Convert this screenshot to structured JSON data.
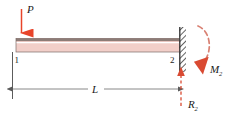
{
  "figure": {
    "type": "beam-free-body-diagram",
    "labels": {
      "applied_load": "P",
      "node_left": "1",
      "node_right": "2",
      "span": "L",
      "moment_reaction": "M",
      "moment_reaction_sub": "2",
      "force_reaction": "R",
      "force_reaction_sub": "2"
    },
    "colors": {
      "load_red": "#e8442a",
      "beam_fill": "#f2cfc9",
      "beam_edge": "#6b5b56",
      "dimension_gray": "#7a7a7a",
      "hatch_dark": "#3b3b3b",
      "reaction_red": "#d94a32",
      "moment_dashed": "#d98274",
      "text_dark": "#1a1a1a"
    }
  }
}
